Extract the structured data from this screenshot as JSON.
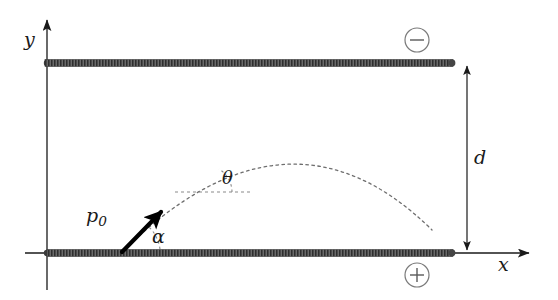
{
  "figure": {
    "width": 558,
    "height": 300,
    "background": "#ffffff"
  },
  "axes": {
    "y_label": "y",
    "x_label": "x",
    "origin": {
      "x": 47,
      "y": 253
    },
    "y_axis_tip": {
      "x": 47,
      "y": 16
    },
    "x_axis_tip": {
      "x": 534,
      "y": 253
    },
    "color": "#1a1a1a"
  },
  "plates": {
    "color": "#454545",
    "thickness_px": 7,
    "top": {
      "name": "negative-plate",
      "charge_symbol": "−",
      "x_start": 45,
      "x_end": 453,
      "y": 63
    },
    "bottom": {
      "name": "positive-plate",
      "charge_symbol": "+",
      "x_start": 47,
      "x_end": 453,
      "y": 253
    }
  },
  "charge_markers": {
    "negative": {
      "symbol": "−",
      "cx": 417,
      "cy": 40,
      "r": 12
    },
    "positive": {
      "symbol": "+",
      "cx": 417,
      "cy": 275,
      "r": 12
    }
  },
  "dimension": {
    "label": "d",
    "description": "plate separation",
    "x": 467,
    "y_top": 63,
    "y_bottom": 253,
    "double_headed": true
  },
  "momentum_vector": {
    "label": "p",
    "label_subscript": "0",
    "description": "initial momentum",
    "tail": {
      "x": 122,
      "y": 252
    },
    "head": {
      "x": 163,
      "y": 210
    },
    "color": "#000000",
    "width_px": 4
  },
  "angles": {
    "alpha": {
      "label": "α",
      "description": "launch angle from bottom plate",
      "vertex": {
        "x": 122,
        "y": 252
      },
      "radius": 36
    },
    "theta": {
      "label": "θ",
      "description": "tangent angle along trajectory",
      "vertex": {
        "x": 205,
        "y": 192
      },
      "radius": 26
    }
  },
  "reference_line": {
    "name": "theta-horizontal-reference",
    "x_start": 175,
    "x_end": 253,
    "y": 192,
    "style": "dashed"
  },
  "trajectory": {
    "name": "parabolic-trajectory",
    "style": "dashed",
    "color": "#666666",
    "start": {
      "x": 122,
      "y": 252
    },
    "apex": {
      "x": 288,
      "y": 153
    },
    "end": {
      "x": 432,
      "y": 230
    }
  }
}
